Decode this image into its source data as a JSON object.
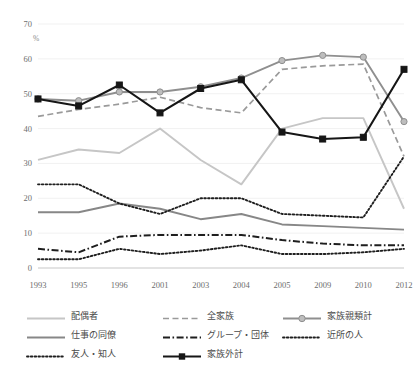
{
  "chart_data": {
    "type": "line",
    "title": "",
    "xlabel": "",
    "ylabel": "%",
    "ylim": [
      0,
      70
    ],
    "ytick_step": 10,
    "grid": true,
    "legend_position": "bottom",
    "yticks": [
      "0",
      "10",
      "20",
      "30",
      "40",
      "50",
      "60",
      "70"
    ],
    "categories": [
      "1993",
      "1995",
      "1996",
      "2001",
      "2003",
      "2004",
      "2005",
      "2009",
      "2010",
      "2012"
    ],
    "series": [
      {
        "name": "配偶者",
        "color": "#c6c6c6",
        "style": "solid",
        "marker": "none",
        "values": [
          31,
          34,
          33,
          40,
          31,
          24,
          40,
          43,
          43,
          17
        ]
      },
      {
        "name": "全家族",
        "color": "#9a9a9a",
        "style": "dashed",
        "marker": "none",
        "values": [
          43.5,
          45.5,
          47,
          49,
          46,
          44.5,
          57,
          58,
          58.5,
          32
        ]
      },
      {
        "name": "家族親類計",
        "color": "#8f8f8f",
        "style": "solid",
        "marker": "circle",
        "values": [
          48.5,
          48,
          50.5,
          50.5,
          52,
          54.5,
          59.5,
          61,
          60.5,
          42
        ]
      },
      {
        "name": "仕事の同僚",
        "color": "#878787",
        "style": "solid",
        "marker": "none",
        "values": [
          16,
          16,
          18.5,
          17,
          14,
          15.5,
          12.5,
          12,
          11.5,
          11
        ]
      },
      {
        "name": "グループ・団体",
        "color": "#1e1e1e",
        "style": "dashdot",
        "marker": "none",
        "values": [
          5.5,
          4.5,
          9,
          9.5,
          9.5,
          9.5,
          8,
          7,
          6.5,
          6.5
        ]
      },
      {
        "name": "近所の人",
        "color": "#1e1e1e",
        "style": "dotted",
        "marker": "none",
        "values": [
          24,
          24,
          18.5,
          15.5,
          20,
          20,
          15.5,
          15,
          14.5,
          32
        ]
      },
      {
        "name": "友人・知人",
        "color": "#1e1e1e",
        "style": "dotted",
        "marker": "none",
        "values": [
          2.5,
          2.5,
          5.5,
          4,
          5,
          6.5,
          4,
          4,
          4.5,
          5.5
        ]
      },
      {
        "name": "家族外計",
        "color": "#161616",
        "style": "solid",
        "marker": "square",
        "values": [
          48.5,
          46.5,
          52.5,
          44.5,
          51.5,
          54,
          39,
          37,
          37.5,
          57
        ]
      }
    ]
  },
  "legend": {
    "entries": [
      {
        "label": "配偶者"
      },
      {
        "label": "全家族"
      },
      {
        "label": "仕事の同僚"
      },
      {
        "label": "グループ・団体"
      },
      {
        "label": "友人・知人"
      },
      {
        "label": "近所の人"
      },
      {
        "label": "家族親類計"
      },
      {
        "label": "家族外計"
      }
    ]
  }
}
